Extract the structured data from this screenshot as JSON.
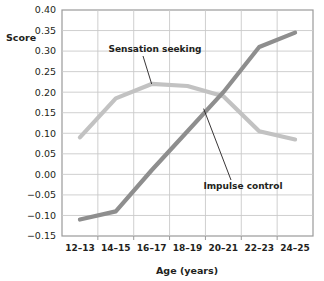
{
  "chart_data": {
    "type": "line",
    "title": "",
    "xlabel": "Age (years)",
    "ylabel": "Score",
    "categories": [
      "12–13",
      "14–15",
      "16–17",
      "18–19",
      "20–21",
      "22–23",
      "24–25"
    ],
    "ylim": [
      -0.15,
      0.4
    ],
    "ytick_labels": [
      "0.40",
      "0.35",
      "0.30",
      "0.25",
      "0.20",
      "0.15",
      "0.10",
      "0.05",
      "0.00",
      "−0.05",
      "−0.10",
      "−0.15"
    ],
    "ytick_values": [
      0.4,
      0.35,
      0.3,
      0.25,
      0.2,
      0.15,
      0.1,
      0.05,
      0.0,
      -0.05,
      -0.1,
      -0.15
    ],
    "grid": true,
    "legend_position": "inline-annotations",
    "series": [
      {
        "name": "Sensation seeking",
        "color": "#c2c2c2",
        "values": [
          0.09,
          0.185,
          0.22,
          0.215,
          0.19,
          0.105,
          0.085
        ]
      },
      {
        "name": "Impulse control",
        "color": "#8e8e8e",
        "values": [
          -0.11,
          -0.09,
          0.01,
          0.105,
          0.2,
          0.31,
          0.345
        ]
      }
    ],
    "annotations": [
      {
        "label": "Sensation seeking",
        "target_category": "16–17",
        "target_value": 0.22
      },
      {
        "label": "Impulse control",
        "target_category": "19–20",
        "target_value": 0.16
      }
    ]
  },
  "axis": {
    "y_title": "Score",
    "x_title": "Age (years)"
  }
}
